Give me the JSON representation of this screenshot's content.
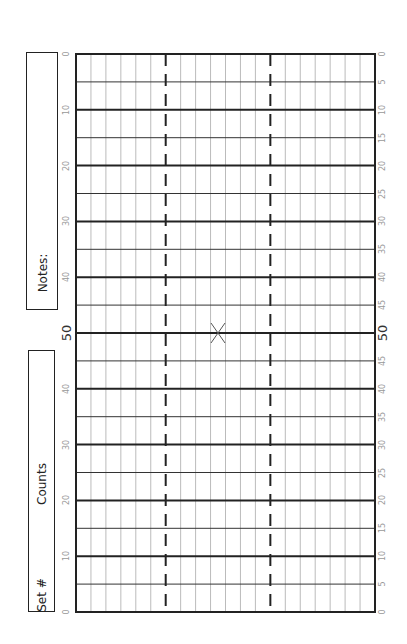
{
  "notes_box": {
    "label": "Notes:"
  },
  "set_box": {
    "set_label": "Set #",
    "counts_label": "Counts"
  },
  "left_axis": {
    "labels": [
      "0",
      "10",
      "20",
      "30",
      "40",
      "50",
      "40",
      "30",
      "20",
      "10",
      "0"
    ]
  },
  "right_axis": {
    "labels": [
      "0",
      "5",
      "10",
      "15",
      "20",
      "25",
      "30",
      "35",
      "40",
      "45",
      "50",
      "45",
      "40",
      "35",
      "30",
      "25",
      "20",
      "15",
      "10",
      "5",
      "0"
    ]
  },
  "grid": {
    "columns": 20,
    "rows": 20,
    "dashed_columns": [
      6,
      13
    ],
    "center_marker": "x-mark",
    "colors": {
      "major": "#222222",
      "minor": "#333333",
      "vertical": "#bbbbbb",
      "label": "#999999"
    }
  }
}
